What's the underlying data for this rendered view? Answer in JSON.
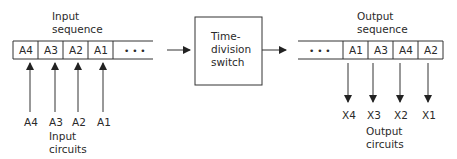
{
  "input": {
    "title_line1": "Input",
    "title_line2": "sequence",
    "cells": [
      "A4",
      "A3",
      "A2",
      "A1"
    ],
    "continuation": "• • •",
    "circuit_labels": [
      "A4",
      "A3",
      "A2",
      "A1"
    ],
    "circuits_line1": "Input",
    "circuits_line2": "circuits"
  },
  "switch": {
    "line1": "Time-",
    "line2": "division",
    "line3": "switch"
  },
  "output": {
    "title_line1": "Output",
    "title_line2": "sequence",
    "continuation": "• • •",
    "cells": [
      "A1",
      "A3",
      "A4",
      "A2"
    ],
    "circuit_labels": [
      "X4",
      "X3",
      "X2",
      "X1"
    ],
    "circuits_line1": "Output",
    "circuits_line2": "circuits"
  },
  "colors": {
    "line": "#333333",
    "text": "#2a2a2a"
  }
}
